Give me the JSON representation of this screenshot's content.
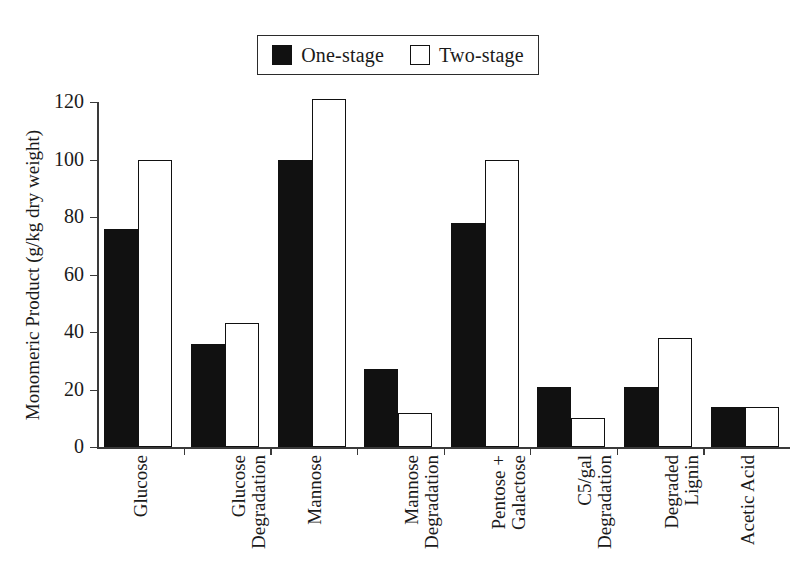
{
  "legend": {
    "entries": [
      {
        "label": "One-stage",
        "swatch": "filled-square",
        "color": "#111111"
      },
      {
        "label": "Two-stage",
        "swatch": "open-square",
        "color": "#ffffff"
      }
    ]
  },
  "axes": {
    "ylabel": "Monomeric Product (g/kg dry weight)",
    "yticks": [
      "0",
      "20",
      "40",
      "60",
      "80",
      "100",
      "120"
    ]
  },
  "chart_data": {
    "type": "bar",
    "title": "",
    "xlabel": "",
    "ylabel": "Monomeric Product (g/kg dry weight)",
    "ylim": [
      0,
      120
    ],
    "ytick_step": 20,
    "grid": false,
    "legend_position": "top-center",
    "categories": [
      "Glucose",
      "Glucose Degradation",
      "Mannose",
      "Mannose Degradation",
      "Pentose + Galactose",
      "C5/gal Degradation",
      "Degraded Lignin",
      "Acetic Acid"
    ],
    "category_lines": [
      [
        "Glucose"
      ],
      [
        "Glucose",
        "Degradation"
      ],
      [
        "Mannose"
      ],
      [
        "Mannose",
        "Degradation"
      ],
      [
        "Pentose +",
        "Galactose"
      ],
      [
        "C5/gal",
        "Degradation"
      ],
      [
        "Degraded",
        "Lignin"
      ],
      [
        "Acetic Acid"
      ]
    ],
    "series": [
      {
        "name": "One-stage",
        "color": "#111111",
        "values": [
          76,
          36,
          100,
          27,
          78,
          21,
          21,
          14
        ]
      },
      {
        "name": "Two-stage",
        "color": "#ffffff",
        "values": [
          100,
          43,
          121,
          12,
          100,
          10,
          38,
          14
        ]
      }
    ]
  }
}
